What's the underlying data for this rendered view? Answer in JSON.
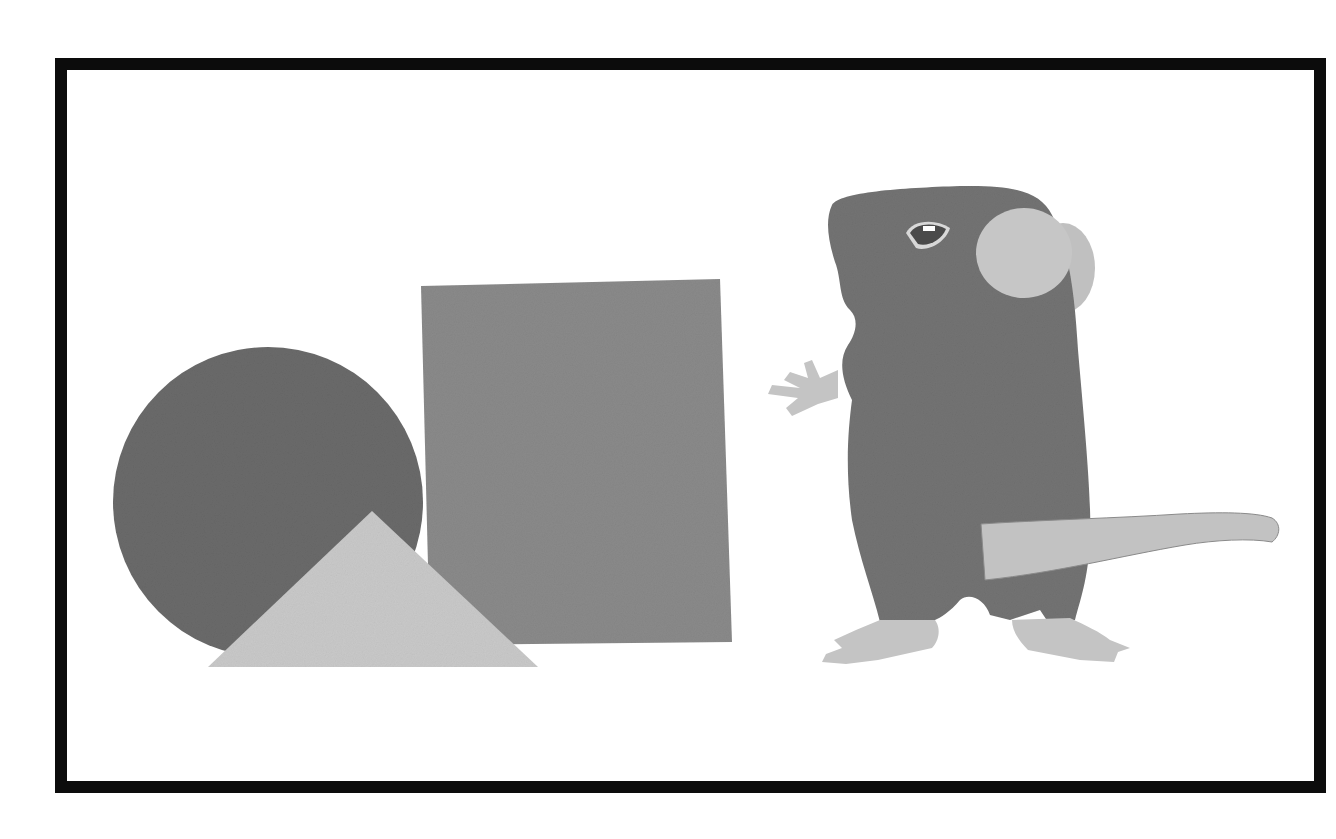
{
  "scene": {
    "title": "Felt shapes and a mouse",
    "frame_color": "#0c0c0c",
    "background": "#ffffff",
    "shapes": [
      {
        "name": "circle",
        "color": "#6a6a6a"
      },
      {
        "name": "triangle",
        "color": "#c9c9c9"
      },
      {
        "name": "rectangle",
        "color": "#8a8a8a"
      }
    ],
    "character": {
      "name": "mouse",
      "body_color": "#737373",
      "ear_color": "#c6c6c6",
      "paw_color": "#c4c4c4",
      "tail_color": "#c2c2c2",
      "eye_color": "#4a4a4a"
    }
  }
}
